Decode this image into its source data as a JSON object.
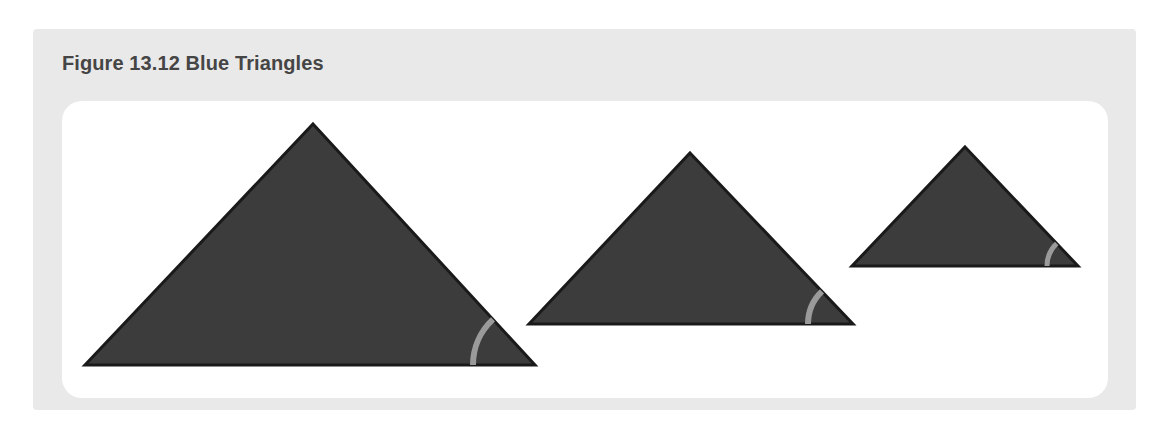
{
  "figure": {
    "caption": "Figure 13.12 Blue Triangles",
    "caption_label_number": "13.12",
    "panel_background_color": "#e9e9e9",
    "canvas_background_color": "#ffffff",
    "caption_color": "#454545"
  },
  "chart_data": {
    "type": "diagram",
    "title": "Figure 13.12 Blue Triangles",
    "subtitle": "",
    "xlabel": "",
    "ylabel": "",
    "grid": false,
    "legend": "none",
    "shape_fill_color": "#3c3c3c",
    "shape_stroke_color": "#1a1a1a",
    "angle_arc_color": "#9a9a9a",
    "shapes": [
      {
        "name": "large-triangle",
        "label": "Triangle 1",
        "size_rank": 1,
        "base_width": 450,
        "height": 241,
        "apex": [
          251,
          23
        ],
        "base_left": [
          23,
          264
        ],
        "base_right": [
          473,
          264
        ],
        "marked_angle_vertex": "bottom-right",
        "angle_arc_radius": 62
      },
      {
        "name": "medium-triangle",
        "label": "Triangle 2",
        "size_rank": 2,
        "base_width": 324,
        "height": 171,
        "apex": [
          628,
          52
        ],
        "base_left": [
          467,
          223
        ],
        "base_right": [
          791,
          223
        ],
        "marked_angle_vertex": "bottom-right",
        "angle_arc_radius": 45
      },
      {
        "name": "small-triangle",
        "label": "Triangle 3",
        "size_rank": 3,
        "base_width": 226,
        "height": 119,
        "apex": [
          903,
          46
        ],
        "base_left": [
          790,
          165
        ],
        "base_right": [
          1016,
          165
        ],
        "marked_angle_vertex": "bottom-right",
        "angle_arc_radius": 31
      }
    ]
  }
}
